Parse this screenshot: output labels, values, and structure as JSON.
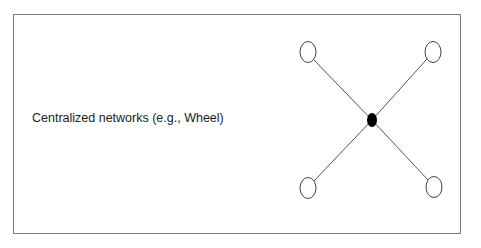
{
  "diagram": {
    "label": "Centralized networks (e.g., Wheel)",
    "network_type": "wheel",
    "nodes": [
      {
        "id": "hub",
        "role": "center",
        "fill": "#000000"
      },
      {
        "id": "top-left",
        "role": "peripheral"
      },
      {
        "id": "top-right",
        "role": "peripheral"
      },
      {
        "id": "bottom-left",
        "role": "peripheral"
      },
      {
        "id": "bottom-right",
        "role": "peripheral"
      }
    ],
    "edges": [
      [
        "hub",
        "top-left"
      ],
      [
        "hub",
        "top-right"
      ],
      [
        "hub",
        "bottom-left"
      ],
      [
        "hub",
        "bottom-right"
      ]
    ]
  }
}
